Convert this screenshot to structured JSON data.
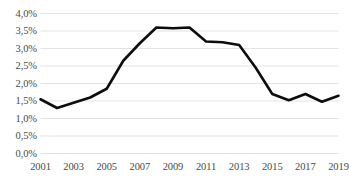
{
  "chart_data": {
    "type": "line",
    "title": "",
    "xlabel": "",
    "ylabel": "",
    "x": [
      2001,
      2002,
      2003,
      2004,
      2005,
      2006,
      2007,
      2008,
      2009,
      2010,
      2011,
      2012,
      2013,
      2014,
      2015,
      2016,
      2017,
      2018,
      2019
    ],
    "values": [
      1.55,
      1.3,
      1.45,
      1.6,
      1.85,
      2.65,
      3.15,
      3.6,
      3.58,
      3.6,
      3.2,
      3.18,
      3.1,
      2.45,
      1.7,
      1.52,
      1.7,
      1.48,
      1.65
    ],
    "series": [
      {
        "name": "series-1",
        "values": [
          1.55,
          1.3,
          1.45,
          1.6,
          1.85,
          2.65,
          3.15,
          3.6,
          3.58,
          3.6,
          3.2,
          3.18,
          3.1,
          2.45,
          1.7,
          1.52,
          1.7,
          1.48,
          1.65
        ]
      }
    ],
    "ylim": [
      0.0,
      4.0
    ],
    "xlim": [
      2001,
      2019
    ],
    "grid": true,
    "grid_axis": "y",
    "legend": false,
    "legend_position": "none",
    "line_color": "#0d0d0d",
    "grid_color": "#e3e3e3",
    "text_color": "#4a4a4a",
    "background_color": "#ffffff",
    "y_ticks": [
      {
        "value": 0.0,
        "label": "0,0%"
      },
      {
        "value": 0.5,
        "label": "0,5%"
      },
      {
        "value": 1.0,
        "label": "1,0%"
      },
      {
        "value": 1.5,
        "label": "1,5%"
      },
      {
        "value": 2.0,
        "label": "2,0%"
      },
      {
        "value": 2.5,
        "label": "2,5%"
      },
      {
        "value": 3.0,
        "label": "3,0%"
      },
      {
        "value": 3.5,
        "label": "3,5%"
      },
      {
        "value": 4.0,
        "label": "4,0%"
      }
    ],
    "x_ticks": [
      {
        "value": 2001,
        "label": "2001"
      },
      {
        "value": 2003,
        "label": "2003"
      },
      {
        "value": 2005,
        "label": "2005"
      },
      {
        "value": 2007,
        "label": "2007"
      },
      {
        "value": 2009,
        "label": "2009"
      },
      {
        "value": 2011,
        "label": "2011"
      },
      {
        "value": 2013,
        "label": "2013"
      },
      {
        "value": 2015,
        "label": "2015"
      },
      {
        "value": 2017,
        "label": "2017"
      },
      {
        "value": 2019,
        "label": "2019"
      }
    ]
  }
}
